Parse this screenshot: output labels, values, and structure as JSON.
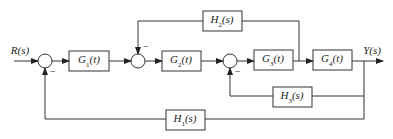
{
  "diagram": {
    "type": "control-system-block-diagram",
    "input": {
      "label": "R(s)"
    },
    "output": {
      "label": "Y(s)"
    },
    "blocks": [
      {
        "id": "G1",
        "name": "G",
        "sub": "1",
        "arg": "(t)"
      },
      {
        "id": "G2",
        "name": "G",
        "sub": "2",
        "arg": "(t)"
      },
      {
        "id": "G3",
        "name": "G",
        "sub": "3",
        "arg": "(t)"
      },
      {
        "id": "G4",
        "name": "G",
        "sub": "4",
        "arg": "(t)"
      },
      {
        "id": "H1",
        "name": "H",
        "sub": "1",
        "arg": "(s)"
      },
      {
        "id": "H2",
        "name": "H",
        "sub": "2",
        "arg": "(s)"
      },
      {
        "id": "H3",
        "name": "H",
        "sub": "3",
        "arg": "(s)"
      }
    ],
    "summing_junctions": [
      {
        "id": "S1",
        "feedback_sign": "−"
      },
      {
        "id": "S2",
        "feedback_sign": "−"
      },
      {
        "id": "S3",
        "feedback_sign": "−"
      }
    ],
    "connections": [
      "R(s) -> S1",
      "S1 -> G1",
      "G1 -> S2",
      "S2 -> G2",
      "G2 -> S3",
      "S3 -> G3",
      "G3 -> G4",
      "G4 -> Y(s)",
      "G3 output -> H2 -> S2 (−)",
      "Y(s) -> H3 -> S3 (−)",
      "Y(s) -> H1 -> S1 (−)"
    ]
  }
}
